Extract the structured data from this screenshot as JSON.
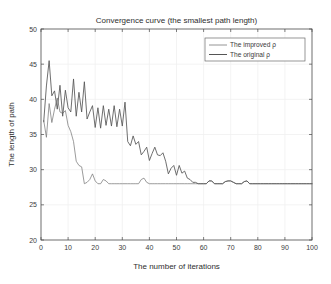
{
  "chart_data": {
    "type": "line",
    "title": "Convergence curve (the smallest path length)",
    "xlabel": "The number of iterations",
    "ylabel": "The length of path",
    "xlim": [
      0,
      100
    ],
    "ylim": [
      20,
      50
    ],
    "xticks": [
      0,
      10,
      20,
      30,
      40,
      50,
      60,
      70,
      80,
      90,
      100
    ],
    "yticks": [
      20,
      25,
      30,
      35,
      40,
      45,
      50
    ],
    "grid": true,
    "legend_position": "top-right",
    "legend": [
      "The improved ρ",
      "The original ρ"
    ],
    "x": [
      1,
      2,
      3,
      4,
      5,
      6,
      7,
      8,
      9,
      10,
      11,
      12,
      13,
      14,
      15,
      16,
      17,
      18,
      19,
      20,
      21,
      22,
      23,
      24,
      25,
      26,
      27,
      28,
      29,
      30,
      31,
      32,
      33,
      34,
      35,
      36,
      37,
      38,
      39,
      40,
      41,
      42,
      43,
      44,
      45,
      46,
      47,
      48,
      49,
      50,
      51,
      52,
      53,
      54,
      55,
      56,
      57,
      58,
      59,
      60,
      61,
      62,
      63,
      64,
      65,
      66,
      67,
      68,
      69,
      70,
      71,
      72,
      73,
      74,
      75,
      76,
      77,
      78,
      79,
      80,
      81,
      82,
      83,
      84,
      85,
      86,
      87,
      88,
      89,
      90,
      91,
      92,
      93,
      94,
      95,
      96,
      97,
      98,
      99,
      100
    ],
    "series": [
      {
        "name": "The improved ρ",
        "color": "#7a7a7a",
        "values": [
          37.0,
          34.6,
          39.4,
          36.7,
          38.6,
          40.2,
          38.2,
          38.0,
          38.4,
          36.3,
          35.4,
          34.0,
          31.2,
          30.6,
          30.4,
          28.0,
          28.2,
          28.6,
          29.4,
          28.4,
          28.0,
          28.0,
          28.6,
          28.4,
          28.0,
          28.0,
          28.0,
          28.0,
          28.0,
          28.0,
          28.0,
          28.0,
          28.0,
          28.0,
          28.0,
          28.0,
          28.6,
          28.8,
          28.2,
          28.0,
          28.0,
          28.0,
          28.0,
          28.0,
          28.0,
          28.0,
          28.0,
          28.0,
          28.0,
          28.0,
          28.0,
          28.0,
          28.0,
          28.0,
          28.0,
          28.0,
          28.0,
          28.0,
          28.0,
          28.0,
          28.0,
          28.4,
          28.4,
          28.0,
          28.0,
          28.0,
          28.0,
          28.3,
          28.4,
          28.4,
          28.2,
          28.0,
          28.0,
          28.0,
          28.3,
          28.4,
          28.0,
          28.0,
          28.0,
          28.0,
          28.0,
          28.0,
          28.0,
          28.0,
          28.0,
          28.0,
          28.0,
          28.0,
          28.0,
          28.0,
          28.0,
          28.0,
          28.0,
          28.0,
          28.0,
          28.0,
          28.0,
          28.0,
          28.0,
          28.0
        ]
      },
      {
        "name": "The original ρ",
        "color": "#555555",
        "values": [
          36.8,
          41.9,
          45.5,
          40.5,
          41.2,
          38.6,
          42.0,
          37.6,
          41.3,
          38.8,
          38.2,
          42.9,
          37.6,
          41.0,
          38.2,
          42.5,
          37.2,
          38.2,
          39.1,
          36.0,
          38.8,
          35.9,
          39.1,
          36.3,
          38.6,
          36.2,
          39.1,
          36.1,
          38.6,
          36.2,
          39.6,
          34.0,
          33.4,
          34.8,
          33.6,
          34.0,
          32.1,
          32.6,
          33.2,
          31.3,
          32.3,
          33.2,
          32.1,
          32.0,
          32.4,
          31.2,
          29.4,
          30.2,
          30.6,
          29.2,
          30.6,
          29.5,
          29.8,
          28.8,
          28.6,
          28.2,
          28.2,
          28.0,
          28.0,
          28.0,
          28.0,
          28.4,
          28.4,
          28.0,
          28.0,
          28.0,
          28.0,
          28.3,
          28.4,
          28.4,
          28.2,
          28.0,
          28.0,
          28.0,
          28.3,
          28.4,
          28.0,
          28.0,
          28.0,
          28.0,
          28.0,
          28.0,
          28.0,
          28.0,
          28.0,
          28.0,
          28.0,
          28.0,
          28.0,
          28.0,
          28.0,
          28.0,
          28.0,
          28.0,
          28.0,
          28.0,
          28.0,
          28.0,
          28.0,
          28.0
        ]
      }
    ]
  },
  "figure": {
    "background_color": "#ffffff",
    "axes_color": "#3c3c3c",
    "grid_color": "#f0f0f0"
  }
}
